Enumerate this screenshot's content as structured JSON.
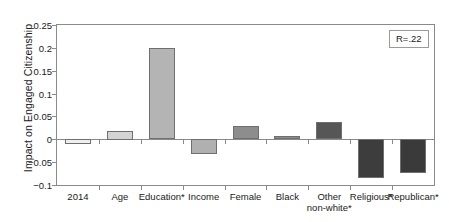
{
  "chart_data": {
    "type": "bar",
    "title": "",
    "xlabel": "",
    "ylabel": "Impact on Engaged Citizenship",
    "ylim": [
      -0.1,
      0.25
    ],
    "ytick_values": [
      0.25,
      0.2,
      0.15,
      0.1,
      0.05,
      0,
      -0.05,
      -0.1
    ],
    "ytick_labels": [
      "0.25",
      "0.2",
      "0.15",
      "0.1",
      "0.05",
      "0",
      "−0.05",
      "−0.1"
    ],
    "grid": false,
    "legend": "none",
    "categories": [
      "2014",
      "Age",
      "Education*",
      "Income",
      "Female",
      "Black",
      "Other non-white*",
      "Religious*",
      "Republican*"
    ],
    "category_labels": [
      [
        "2014"
      ],
      [
        "Age"
      ],
      [
        "Education*"
      ],
      [
        "Income"
      ],
      [
        "Female"
      ],
      [
        "Black"
      ],
      [
        "Other",
        "non-white*"
      ],
      [
        "Religious*"
      ],
      [
        "Republican*"
      ]
    ],
    "values": [
      -0.011,
      0.019,
      0.2,
      -0.032,
      0.028,
      0.007,
      0.037,
      -0.085,
      -0.074
    ],
    "bar_colors": [
      "#efefef",
      "#d4d4d4",
      "#b4b4b4",
      "#b0b0b0",
      "#8d8d8d",
      "#8d8d8d",
      "#565656",
      "#3d3d3d",
      "#3a3a3a"
    ],
    "bar_edge_color": "#6f6f6f",
    "axis_color": "#8a8a8a",
    "annotation": "R=.22"
  },
  "annotation_box": {
    "text": "R=.22"
  },
  "axis": {
    "y_title": "Impact on Engaged Citizenship"
  }
}
